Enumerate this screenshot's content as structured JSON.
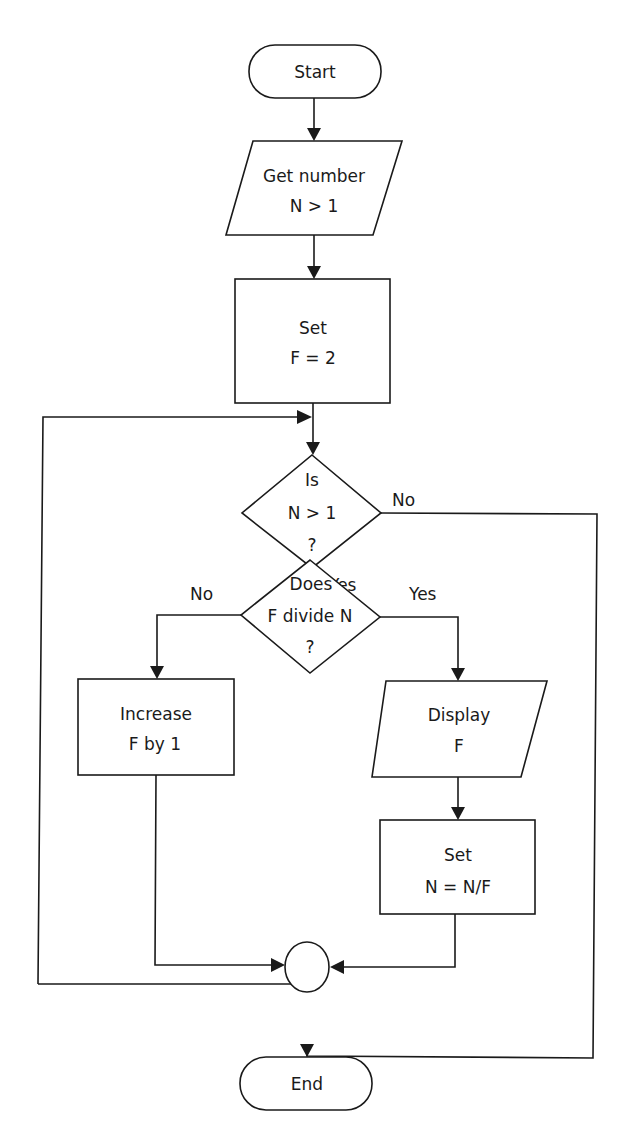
{
  "flowchart": {
    "start": {
      "label": "Start"
    },
    "input": {
      "line1": "Get number",
      "line2": "N > 1"
    },
    "init": {
      "line1": "Set",
      "line2": "F = 2"
    },
    "decision1": {
      "line1": "Is",
      "line2": "N > 1",
      "line3": "?",
      "no_label": "No",
      "yes_label": "Yes"
    },
    "decision2": {
      "line1": "Does",
      "line2": "F divide N",
      "line3": "?",
      "no_label": "No",
      "yes_label": "Yes"
    },
    "increase": {
      "line1": "Increase",
      "line2": "F by 1"
    },
    "display": {
      "line1": "Display",
      "line2": "F"
    },
    "update": {
      "line1": "Set",
      "line2": "N = N/F"
    },
    "connector": {
      "label": ""
    },
    "end": {
      "label": "End"
    }
  },
  "colors": {
    "stroke": "#1a1a1a",
    "background": "#ffffff"
  }
}
